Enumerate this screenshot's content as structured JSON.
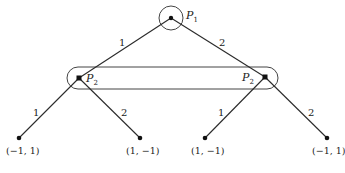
{
  "diagram": {
    "type": "extensive-form-game-tree",
    "root": {
      "player": "P",
      "player_sub": "1"
    },
    "branches_level1": [
      {
        "label": "1"
      },
      {
        "label": "2"
      }
    ],
    "information_set": {
      "player": "P",
      "player_sub": "2",
      "nodes": [
        "left",
        "right"
      ]
    },
    "branches_level2": [
      {
        "label": "1"
      },
      {
        "label": "2"
      },
      {
        "label": "1"
      },
      {
        "label": "2"
      }
    ],
    "leaves": [
      {
        "payoff": "(−1, 1)"
      },
      {
        "payoff": "(1, −1)"
      },
      {
        "payoff": "(1, −1)"
      },
      {
        "payoff": "(−1, 1)"
      }
    ]
  }
}
